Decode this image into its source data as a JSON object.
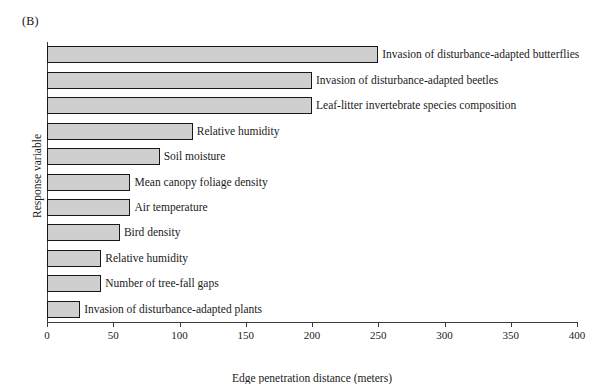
{
  "panel": {
    "label": "(B)"
  },
  "chart_data": {
    "type": "bar",
    "orientation": "horizontal",
    "title": "",
    "subtitle": "",
    "xlabel": "Edge penetration distance (meters)",
    "ylabel": "Response variable",
    "xlim": [
      0,
      400
    ],
    "xticks": [
      0,
      50,
      100,
      150,
      200,
      250,
      300,
      350,
      400
    ],
    "xtick_labels": [
      "0",
      "50",
      "100",
      "150",
      "200",
      "250",
      "300",
      "350",
      "400"
    ],
    "grid": false,
    "legend": null,
    "bar_fill_color": "#cfcfcf",
    "bar_edge_color": "#171717",
    "categories": [
      "Invasion of disturbance-adapted butterflies",
      "Invasion of disturbance-adapted beetles",
      "Leaf-litter invertebrate species composition",
      "Relative humidity",
      "Soil moisture",
      "Mean canopy foliage density",
      "Air temperature",
      "Bird density",
      "Relative humidity",
      "Number of tree-fall gaps",
      "Invasion of disturbance-adapted plants"
    ],
    "values": [
      250,
      200,
      200,
      110,
      85,
      63,
      63,
      55,
      41,
      41,
      25
    ]
  }
}
